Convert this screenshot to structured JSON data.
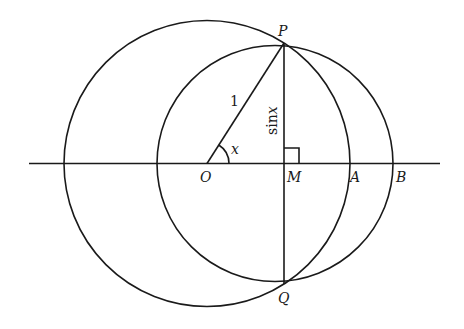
{
  "diagram": {
    "type": "geometry",
    "points": {
      "P": "P",
      "Q": "Q",
      "O": "O",
      "M": "M",
      "A": "A",
      "B": "B"
    },
    "labels": {
      "radius": "1",
      "angle": "x",
      "height_fn": "sin",
      "height_var": "x"
    },
    "colors": {
      "stroke": "#1a1a1a",
      "background": "#ffffff"
    }
  }
}
